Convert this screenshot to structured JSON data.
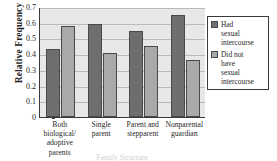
{
  "chart_data": {
    "type": "bar",
    "title": "",
    "subtitle": "",
    "xlabel": "Family Structure",
    "ylabel": "Relative Frequency",
    "ylim": [
      0,
      0.7
    ],
    "yticks": [
      "0",
      "0.1",
      "0.2",
      "0.3",
      "0.4",
      "0.5",
      "0.6",
      "0.7"
    ],
    "ytick_values": [
      0,
      0.1,
      0.2,
      0.3,
      0.4,
      0.5,
      0.6,
      0.7
    ],
    "grid": "horizontal",
    "legend_position": "right",
    "categories": [
      "Both biological/ adoptive parents",
      "Single parent",
      "Parent and stepparent",
      "Nonparental guardian"
    ],
    "category_lines": [
      [
        "Both",
        "biological/",
        "adoptive",
        "parents"
      ],
      [
        "Single",
        "parent"
      ],
      [
        "Parent and",
        "stepparent"
      ],
      [
        "Nonparental",
        "guardian"
      ]
    ],
    "series": [
      {
        "name": "Had sexual intercourse",
        "name_lines": [
          "Had",
          "sexual",
          "intercourse"
        ],
        "color": "#6e6e6e",
        "values": [
          0.43,
          0.59,
          0.55,
          0.65
        ]
      },
      {
        "name": "Did not have sexual intercourse",
        "name_lines": [
          "Did not",
          "have",
          "sexual",
          "intercourse"
        ],
        "color": "#a9a9a9",
        "values": [
          0.58,
          0.41,
          0.45,
          0.36
        ]
      }
    ]
  },
  "colors": {
    "series_0": "#6e6e6e",
    "series_1": "#a9a9a9",
    "plot_background": "#e8e8e8",
    "gridline": "#b9b9b9",
    "axis": "#3a3a3a",
    "text": "#1f1f1f"
  }
}
